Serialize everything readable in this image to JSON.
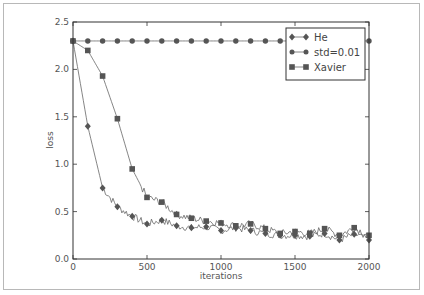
{
  "chart_data": {
    "type": "line",
    "title": "",
    "xlabel": "iterations",
    "ylabel": "loss",
    "xlim": [
      0,
      2000
    ],
    "ylim": [
      0.0,
      2.5
    ],
    "xticks": [
      "0",
      "500",
      "1000",
      "1500",
      "2000"
    ],
    "yticks": [
      "0.0",
      "0.5",
      "1.0",
      "1.5",
      "2.0",
      "2.5"
    ],
    "grid": false,
    "legend_position": "upper right",
    "x": [
      0,
      100,
      200,
      300,
      400,
      500,
      600,
      700,
      800,
      900,
      1000,
      1100,
      1200,
      1300,
      1400,
      1500,
      1600,
      1700,
      1800,
      1900,
      2000
    ],
    "series": [
      {
        "name": "He",
        "marker": "diamond",
        "values": [
          2.3,
          1.4,
          0.75,
          0.55,
          0.45,
          0.37,
          0.41,
          0.35,
          0.33,
          0.34,
          0.3,
          0.33,
          0.3,
          0.27,
          0.25,
          0.25,
          0.24,
          0.27,
          0.2,
          0.26,
          0.2
        ]
      },
      {
        "name": "std=0.01",
        "marker": "circle",
        "values": [
          2.3,
          2.3,
          2.3,
          2.3,
          2.3,
          2.3,
          2.3,
          2.3,
          2.3,
          2.3,
          2.3,
          2.3,
          2.3,
          2.3,
          2.3,
          2.3,
          2.3,
          2.3,
          2.3,
          2.3,
          2.3
        ]
      },
      {
        "name": "Xavier",
        "marker": "square",
        "values": [
          2.3,
          2.2,
          1.93,
          1.48,
          0.95,
          0.65,
          0.6,
          0.47,
          0.43,
          0.4,
          0.38,
          0.35,
          0.37,
          0.32,
          0.27,
          0.29,
          0.27,
          0.32,
          0.25,
          0.33,
          0.25
        ]
      }
    ]
  },
  "colors": {
    "line": "#666666",
    "marker": "#555555",
    "axis": "#333333",
    "frame": "#b8b8b8"
  }
}
